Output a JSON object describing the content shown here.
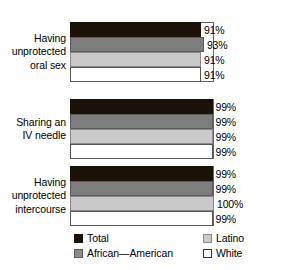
{
  "chart_data": {
    "type": "bar",
    "orientation": "horizontal",
    "title": "",
    "subtitle": "",
    "xlabel": "",
    "ylabel": "",
    "xlim": [
      0,
      100
    ],
    "grid": false,
    "legend_position": "bottom",
    "categories": [
      "Having unprotected oral sex",
      "Sharing an IV needle",
      "Having unprotected intercourse"
    ],
    "series": [
      {
        "name": "Total",
        "color": "#1a1209",
        "values": [
          91,
          99,
          99
        ]
      },
      {
        "name": "African—American",
        "color": "#7d7d7d",
        "values": [
          93,
          99,
          99
        ]
      },
      {
        "name": "Latino",
        "color": "#c9c9c9",
        "values": [
          91,
          99,
          100
        ]
      },
      {
        "name": "White",
        "color": "#ffffff",
        "values": [
          91,
          99,
          99
        ]
      }
    ],
    "value_labels": [
      [
        "91%",
        "93%",
        "91%",
        "91%"
      ],
      [
        "99%",
        "99%",
        "99%",
        "99%"
      ],
      [
        "99%",
        "99%",
        "100%",
        "99%"
      ]
    ]
  },
  "groups": [
    {
      "label_lines": [
        "Having",
        "unprotected",
        "oral sex"
      ],
      "bars": [
        {
          "series": "Total",
          "value": 91,
          "label": "91%"
        },
        {
          "series": "African—American",
          "value": 93,
          "label": "93%"
        },
        {
          "series": "Latino",
          "value": 91,
          "label": "91%"
        },
        {
          "series": "White",
          "value": 91,
          "label": "91%"
        }
      ]
    },
    {
      "label_lines": [
        "Sharing an",
        "IV needle"
      ],
      "bars": [
        {
          "series": "Total",
          "value": 99,
          "label": "99%"
        },
        {
          "series": "African—American",
          "value": 99,
          "label": "99%"
        },
        {
          "series": "Latino",
          "value": 99,
          "label": "99%"
        },
        {
          "series": "White",
          "value": 99,
          "label": "99%"
        }
      ]
    },
    {
      "label_lines": [
        "Having",
        "unprotected",
        "intercourse"
      ],
      "bars": [
        {
          "series": "Total",
          "value": 99,
          "label": "99%"
        },
        {
          "series": "African—American",
          "value": 99,
          "label": "99%"
        },
        {
          "series": "Latino",
          "value": 100,
          "label": "100%"
        },
        {
          "series": "White",
          "value": 99,
          "label": "99%"
        }
      ]
    }
  ],
  "legend": {
    "items": [
      {
        "label": "Total",
        "swatch": "total",
        "color": "#1a1209"
      },
      {
        "label": "Latino",
        "swatch": "latino",
        "color": "#c9c9c9"
      },
      {
        "label": "African—American",
        "swatch": "africanam",
        "color": "#8a8a8a"
      },
      {
        "label": "White",
        "swatch": "white",
        "color": "#ffffff"
      }
    ]
  }
}
